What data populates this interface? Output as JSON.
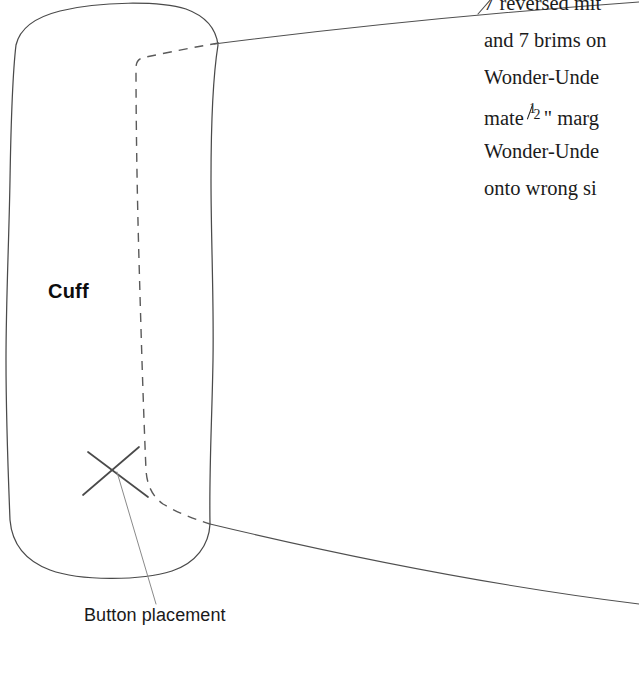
{
  "page": {
    "width": 639,
    "height": 674,
    "background": "#ffffff",
    "ink_color": "#3d3d3d",
    "text_color": "#1b1b1b"
  },
  "diagram": {
    "piece_label": "Cuff",
    "annotation_label": "Button placement",
    "marks": {
      "button_mark": "x-cross-mark",
      "fold_line": "dashed-fold-line",
      "piece_outline": "solid-outline",
      "leader_line": "leader-line",
      "guide_curve_top": "page-guide-curve-top",
      "guide_curve_bottom": "page-guide-curve-bottom"
    }
  },
  "instructions": {
    "lines": [
      "7 reversed mit",
      "and 7 brims on",
      "Wonder-Unde",
      "mate ",
      "Wonder-Unde",
      "onto wrong si"
    ],
    "line4_fraction_numerator": "1",
    "line4_fraction_denominator": "2",
    "line4_tail": "\" marg"
  }
}
